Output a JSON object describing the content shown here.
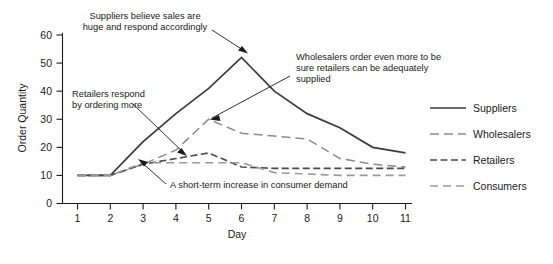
{
  "chart_data": {
    "type": "line",
    "title": "",
    "xlabel": "Day",
    "ylabel": "Order Quantity",
    "x": [
      1,
      2,
      3,
      4,
      5,
      6,
      7,
      8,
      9,
      10,
      11
    ],
    "xlim": [
      1,
      11
    ],
    "ylim": [
      0,
      60
    ],
    "yticks": [
      0,
      10,
      20,
      30,
      40,
      50,
      60
    ],
    "xticks": [
      1,
      2,
      3,
      4,
      5,
      6,
      7,
      8,
      9,
      10,
      11
    ],
    "grid": false,
    "legend_position": "right",
    "series": [
      {
        "name": "Suppliers",
        "style": "solid",
        "color": "#3b3b3b",
        "values": [
          10,
          10,
          22,
          32,
          41,
          52,
          40,
          32,
          27,
          20,
          18
        ]
      },
      {
        "name": "Wholesalers",
        "style": "long-dash",
        "color": "#8a8a8a",
        "values": [
          10,
          10,
          14,
          19,
          30,
          25,
          24,
          23,
          16,
          14,
          13
        ]
      },
      {
        "name": "Retailers",
        "style": "dash-dot",
        "color": "#4a4a4a",
        "values": [
          10,
          10,
          14,
          16,
          18,
          13,
          12.5,
          12.5,
          12.5,
          12.5,
          12.5
        ]
      },
      {
        "name": "Consumers",
        "style": "dashed",
        "color": "#9a9a9a",
        "values": [
          10,
          10,
          14.5,
          14.5,
          14.5,
          14.5,
          11,
          10.5,
          10,
          10,
          10
        ]
      }
    ],
    "annotations": [
      {
        "id": "suppliers-annotation",
        "lines": [
          "Suppliers believe sales are",
          "huge and respond accordingly"
        ],
        "points_to": "Suppliers line rising toward peak"
      },
      {
        "id": "wholesalers-annotation",
        "lines": [
          "Wholesalers order even more to be",
          "sure retailers can be adequately",
          "supplied"
        ],
        "points_to": "Wholesalers line peak"
      },
      {
        "id": "retailers-annotation",
        "lines": [
          "Retailers respond",
          "by ordering more"
        ],
        "points_to": "Retailers line rise"
      },
      {
        "id": "consumers-annotation",
        "lines": [
          "A short-term increase in consumer demand"
        ],
        "points_to": "Consumers line rise"
      }
    ]
  },
  "legend": {
    "items": [
      {
        "label": "Suppliers"
      },
      {
        "label": "Wholesalers"
      },
      {
        "label": "Retailers"
      },
      {
        "label": "Consumers"
      }
    ]
  }
}
